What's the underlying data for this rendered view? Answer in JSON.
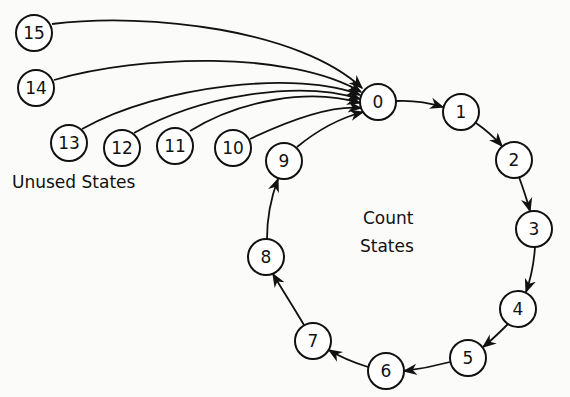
{
  "diagram": {
    "type": "state-transition",
    "labels": {
      "unused": "Unused States",
      "count_line1": "Count",
      "count_line2": "States"
    },
    "nodes": [
      {
        "id": "0",
        "label": "0",
        "x": 378,
        "y": 102,
        "group": "count"
      },
      {
        "id": "1",
        "label": "1",
        "x": 461,
        "y": 112,
        "group": "count"
      },
      {
        "id": "2",
        "label": "2",
        "x": 514,
        "y": 160,
        "group": "count"
      },
      {
        "id": "3",
        "label": "3",
        "x": 534,
        "y": 229,
        "group": "count"
      },
      {
        "id": "4",
        "label": "4",
        "x": 518,
        "y": 309,
        "group": "count"
      },
      {
        "id": "5",
        "label": "5",
        "x": 468,
        "y": 358,
        "group": "count"
      },
      {
        "id": "6",
        "label": "6",
        "x": 386,
        "y": 371,
        "group": "count"
      },
      {
        "id": "7",
        "label": "7",
        "x": 313,
        "y": 341,
        "group": "count"
      },
      {
        "id": "8",
        "label": "8",
        "x": 266,
        "y": 257,
        "group": "count"
      },
      {
        "id": "9",
        "label": "9",
        "x": 284,
        "y": 161,
        "group": "count"
      },
      {
        "id": "10",
        "label": "10",
        "x": 233,
        "y": 148,
        "group": "unused"
      },
      {
        "id": "11",
        "label": "11",
        "x": 175,
        "y": 146,
        "group": "unused"
      },
      {
        "id": "12",
        "label": "12",
        "x": 122,
        "y": 148,
        "group": "unused"
      },
      {
        "id": "13",
        "label": "13",
        "x": 69,
        "y": 143,
        "group": "unused"
      },
      {
        "id": "14",
        "label": "14",
        "x": 36,
        "y": 88,
        "group": "unused"
      },
      {
        "id": "15",
        "label": "15",
        "x": 34,
        "y": 33,
        "group": "unused"
      }
    ],
    "edges": [
      {
        "from": "0",
        "to": "1"
      },
      {
        "from": "1",
        "to": "2"
      },
      {
        "from": "2",
        "to": "3"
      },
      {
        "from": "3",
        "to": "4"
      },
      {
        "from": "4",
        "to": "5"
      },
      {
        "from": "5",
        "to": "6"
      },
      {
        "from": "6",
        "to": "7"
      },
      {
        "from": "7",
        "to": "8"
      },
      {
        "from": "8",
        "to": "9"
      },
      {
        "from": "9",
        "to": "0"
      },
      {
        "from": "10",
        "to": "0"
      },
      {
        "from": "11",
        "to": "0"
      },
      {
        "from": "12",
        "to": "0"
      },
      {
        "from": "13",
        "to": "0"
      },
      {
        "from": "14",
        "to": "0"
      },
      {
        "from": "15",
        "to": "0"
      }
    ]
  }
}
